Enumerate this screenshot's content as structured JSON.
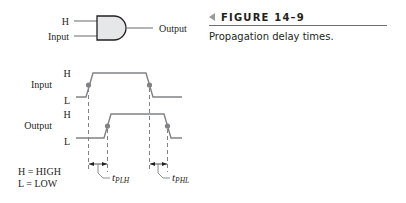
{
  "gate": {
    "type": "AND",
    "input_top_label": "H",
    "input_bottom_label": "Input",
    "output_label": "Output",
    "fill_color": "#e6e7e8",
    "stroke_color": "#231f20"
  },
  "figure": {
    "number_label": "FIGURE 14–9",
    "caption": "Propagation delay times."
  },
  "timing": {
    "input_signal_label": "Input",
    "output_signal_label": "Output",
    "high_label": "H",
    "low_label": "L",
    "tplh_label": "t",
    "tplh_sub": "PLH",
    "tphl_label": "t",
    "tphl_sub": "PHL",
    "waveform_color": "#808285",
    "dot_color": "#808285"
  },
  "legend": {
    "high_def": "H = HIGH",
    "low_def": "L = LOW"
  }
}
